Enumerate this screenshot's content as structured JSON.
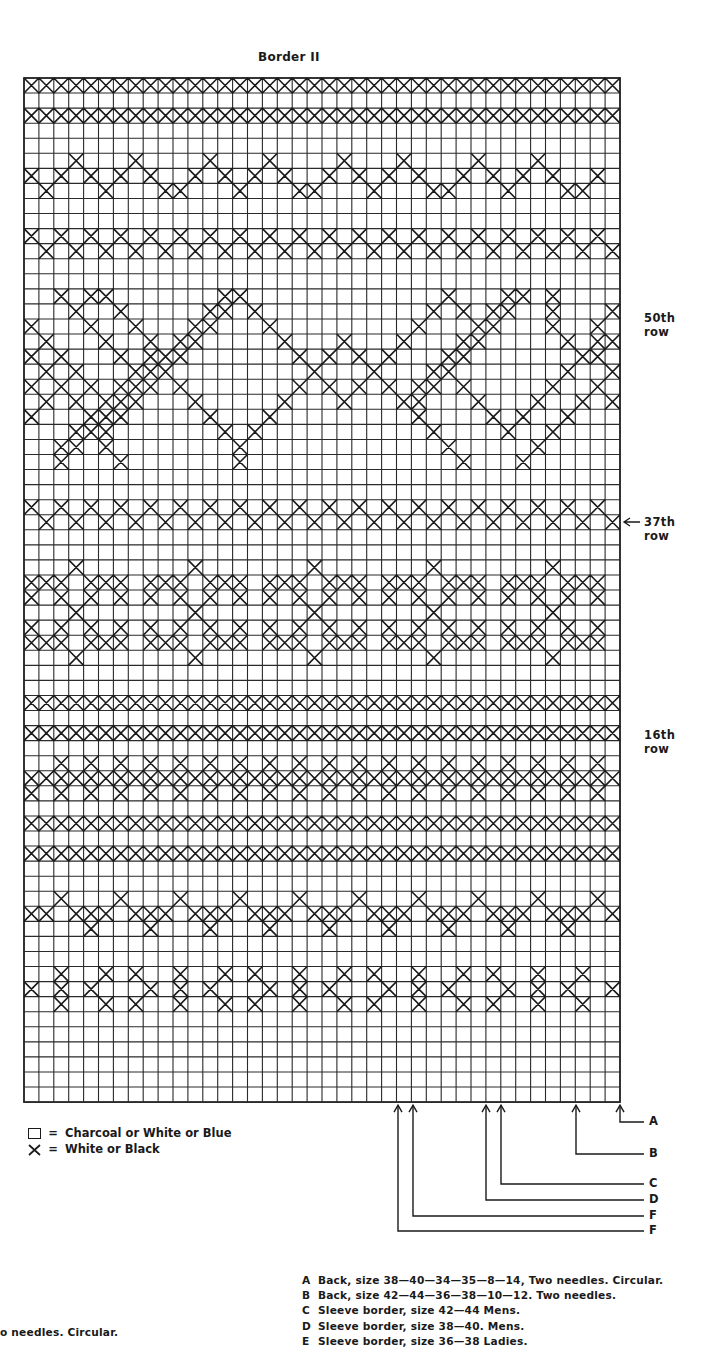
{
  "document": {
    "title": "Border II",
    "grid": {
      "left": 24,
      "top": 78,
      "cell_w": 14.9,
      "cell_h": 15.06,
      "cols": 40,
      "rows": 68,
      "line_color": "#2a2a2a",
      "mark_color": "#1a1a1a"
    },
    "pattern_rows": [
      "XXXXXXXXXXXXXXXXXXXXXXXXXXXXXXXXXXXXXXXX",
      "........................................",
      "XXXXXXXXXXXXXXXXXXXXXXXXXXXXXXXXXXXXXXXX",
      "........................................",
      "........................................",
      "...X...X....X...X....X...X....X...X.....",
      "X.X.X.X.X..X.X.X.X..X.X.X.X..X.X.X.X..X",
      ".X...X...XX...X...XX...X...XX...X...XX..",
      "........................................",
      "........................................",
      "X.X.X.X.X.X.X.X.X.X.X.X.X.X.X.X.X.X.X.X.",
      ".X.X.X.X.X.X.X.X.X.X.X.X.X.X.X.X.X.X.X.X",
      "........................................",
      "........................................",
      "..X.XX.......XX.............X...XX.X....",
      "...X..X.....XX.X...........X.X.XX..X...X",
      "X...X..X...XX...X.........X...XX...X..X.",
      ".X...X..X.XX.....X...X...X...XX.....X.XX",
      "X.X...X.XXX.......X.X.X.X...XX.......XX.X",
      ".X.X...XXX.........X...X...XX.......X..X.",
      "X.X.X.XXX.X.......X.X.X.X.XX.X.....X..X.X",
      ".X.X.XXX...X.....X...X...XX...X...X..X.X.",
      "X...XXX.....X...X.........X....X.X..X...X",
      "...XXX.......X.X...........X....X..X.....",
      "..XX.X........X.............X.....X......",
      "..X...X.......X..............X...X.......",
      "........................................",
      "........................................",
      "X.X.X.X.X.X.X.X.X.X.X.X.X.X.X.X.X.X.X.X.",
      ".X.X.X.X.X.X.X.X.X.X.X.X.X.X.X.X.X.X.X.X",
      "........................................",
      "........................................",
      "...X.......X.......X.......X.......X....",
      "XXX.XXX.XXX.XXX.XXX.XXX.XXX.XXX.XXX.XXX",
      "X.X.X.X.X.X.X.X.X.X.X.X.X.X.X.X.X.X.X.X",
      "...X.......X.......X.......X.......X....",
      "X.X.X.X.X.X.X.X.X.X.X.X.X.X.X.X.X.X.X.X",
      "XXX.XXX.XXX.XXX.XXX.XXX.XXX.XXX.XXX.XXX",
      "...X.......X.......X.......X.......X....",
      "........................................",
      "........................................",
      "XXXXXXXXXXXXXXXXXXXXXXXXXXXXXXXXXXXXXXXX",
      "........................................",
      "XXXXXXXXXXXXXXXXXXXXXXXXXXXXXXXXXXXXXXXX",
      "........................................",
      "..X.X.X.X.X.X.X.X.X.X.X.X.X.X.X.X.X.X.X",
      "XXXXXXXXXXXXXXXXXXXXXXXXXXXXXXXXXXXXXXXX",
      "X.X.X.X.X.X.X.X.X.X.X.X.X.X.X.X.X.X.X.X.",
      "........................................",
      "XXXXXXXXXXXXXXXXXXXXXXXXXXXXXXXXXXXXXXXX",
      "........................................",
      "XXXXXXXXXXXXXXXXXXXXXXXXXXXXXXXXXXXXXXXX",
      "........................................",
      "........................................",
      "..X...X...X...X...X...X...X...X...X...X.",
      "XX.XXX.XXX.XXX.XXX.XXX.XXX.XXX.XXX.XXX.X",
      "....X...X...X...X...X...X...X...X...X...",
      "........................................",
      "........................................",
      "..X..X.X..X..X.X..X..X.X..X..X.X..X..X.",
      "X.X.X...X.X.X...X.X.X...X.X.X...X.X.X..X",
      "..X..X.X..X..X.X..X..X.X..X..X.X..X..X.",
      "........................................",
      "........................................",
      "........................................",
      "........................................",
      "........................................",
      "........................................"
    ],
    "row_labels": [
      {
        "text": "50th row",
        "x": 644,
        "y": 318,
        "arrow": false
      },
      {
        "text": "37th row",
        "x": 644,
        "y": 522,
        "arrow": true
      },
      {
        "text": "16th row",
        "x": 644,
        "y": 735,
        "arrow": false
      }
    ],
    "legend": [
      {
        "symbol": "box",
        "equals": "=",
        "text": "Charcoal or White or Blue"
      },
      {
        "symbol": "cross",
        "equals": "=",
        "text": "White or Black"
      }
    ],
    "callouts": [
      {
        "letter": "A",
        "arrow_x": 620,
        "line_y": 1122
      },
      {
        "letter": "B",
        "arrow_x": 576,
        "line_y": 1154
      },
      {
        "letter": "C",
        "arrow_x": 501,
        "line_y": 1184
      },
      {
        "letter": "D",
        "arrow_x": 486,
        "line_y": 1200
      },
      {
        "letter": "F",
        "arrow_x": 413,
        "line_y": 1216
      },
      {
        "letter": "F",
        "arrow_x": 398,
        "line_y": 1231
      }
    ],
    "notes": [
      {
        "key": "A",
        "text": "Back, size 38—40—34—35—8—14, Two needles. Circular."
      },
      {
        "key": "B",
        "text": "Back, size 42—44—36—38—10—12. Two needles."
      },
      {
        "key": "C",
        "text": "Sleeve border, size 42—44 Mens."
      },
      {
        "key": "D",
        "text": "Sleeve border, size 38—40. Mens."
      },
      {
        "key": "E",
        "text": "Sleeve border, size 36—38 Ladies."
      }
    ],
    "left_fragment": "o needles. Circular."
  }
}
